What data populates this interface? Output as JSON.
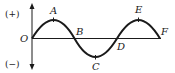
{
  "diagram": {
    "type": "sine-wave",
    "axis_labels": {
      "positive": "(+)",
      "negative": "(−)"
    },
    "points": [
      {
        "id": "O",
        "label": "O",
        "role": "origin"
      },
      {
        "id": "A",
        "label": "A",
        "role": "crest"
      },
      {
        "id": "B",
        "label": "B",
        "role": "zero-crossing"
      },
      {
        "id": "C",
        "label": "C",
        "role": "trough"
      },
      {
        "id": "D",
        "label": "D",
        "role": "zero-crossing"
      },
      {
        "id": "E",
        "label": "E",
        "role": "crest"
      },
      {
        "id": "F",
        "label": "F",
        "role": "end-zero"
      }
    ],
    "colors": {
      "line": "#1a1a1a",
      "background": "#ffffff"
    }
  }
}
